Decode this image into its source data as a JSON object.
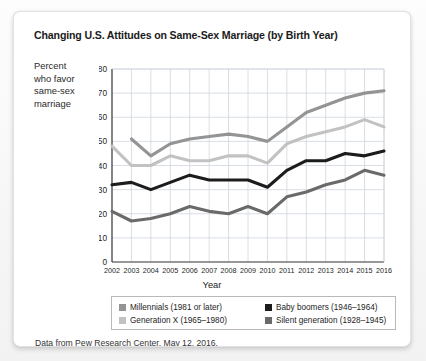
{
  "card": {
    "source_note": "Data from Pew Research Center, May 12, 2016."
  },
  "axis_label_block": {
    "line1": "Percent",
    "line2": "who favor",
    "line3": "same-sex",
    "line4": "marriage"
  },
  "legend": {
    "items": [
      {
        "label": "Millennials (1981 or later)",
        "color": "#949494"
      },
      {
        "label": "Baby boomers (1946–1964)",
        "color": "#1c1c1c"
      },
      {
        "label": "Generation X (1965–1980)",
        "color": "#c2c2c2"
      },
      {
        "label": "Silent generation (1928–1945)",
        "color": "#6a6a6a"
      }
    ]
  },
  "chart_data": {
    "type": "line",
    "title": "Changing U.S. Attitudes on Same-Sex Marriage (by Birth Year)",
    "xlabel": "Year",
    "ylabel": "Percent who favor same-sex marriage",
    "categories": [
      2002,
      2003,
      2004,
      2005,
      2006,
      2007,
      2008,
      2009,
      2010,
      2011,
      2012,
      2013,
      2014,
      2015,
      2016
    ],
    "xlim": [
      2002,
      2016
    ],
    "ylim": [
      0,
      80
    ],
    "yticks": [
      0,
      10,
      20,
      30,
      40,
      50,
      60,
      70,
      80
    ],
    "grid": true,
    "legend_position": "bottom",
    "series": [
      {
        "name": "Millennials (1981 or later)",
        "color": "#949494",
        "x": [
          2003,
          2004,
          2005,
          2006,
          2007,
          2008,
          2009,
          2010,
          2011,
          2012,
          2013,
          2014,
          2015,
          2016
        ],
        "values": [
          51,
          44,
          49,
          51,
          52,
          53,
          52,
          50,
          56,
          62,
          65,
          68,
          70,
          71
        ]
      },
      {
        "name": "Generation X (1965–1980)",
        "color": "#c2c2c2",
        "x": [
          2002,
          2003,
          2004,
          2005,
          2006,
          2007,
          2008,
          2009,
          2010,
          2011,
          2012,
          2013,
          2014,
          2015,
          2016
        ],
        "values": [
          48,
          40,
          40,
          44,
          42,
          42,
          44,
          44,
          41,
          49,
          52,
          54,
          56,
          59,
          56
        ]
      },
      {
        "name": "Baby boomers (1946–1964)",
        "color": "#1c1c1c",
        "x": [
          2002,
          2003,
          2004,
          2005,
          2006,
          2007,
          2008,
          2009,
          2010,
          2011,
          2012,
          2013,
          2014,
          2015,
          2016
        ],
        "values": [
          32,
          33,
          30,
          33,
          36,
          34,
          34,
          34,
          31,
          38,
          42,
          42,
          45,
          44,
          46
        ]
      },
      {
        "name": "Silent generation (1928–1945)",
        "color": "#6a6a6a",
        "x": [
          2002,
          2003,
          2004,
          2005,
          2006,
          2007,
          2008,
          2009,
          2010,
          2011,
          2012,
          2013,
          2014,
          2015,
          2016
        ],
        "values": [
          21,
          17,
          18,
          20,
          23,
          21,
          20,
          23,
          20,
          27,
          29,
          32,
          34,
          38,
          36
        ]
      }
    ]
  }
}
